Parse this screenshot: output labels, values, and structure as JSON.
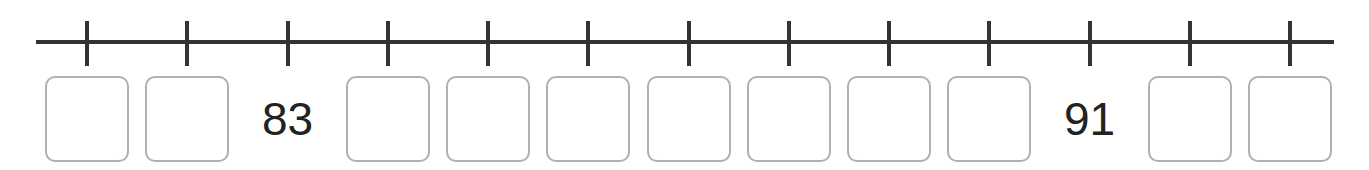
{
  "number_line": {
    "start": 81,
    "end": 93,
    "step": 1,
    "line_color": "#333333",
    "box_border_color": "#b0b0b0",
    "ticks": [
      {
        "value": 81,
        "shown": false,
        "label": ""
      },
      {
        "value": 82,
        "shown": false,
        "label": ""
      },
      {
        "value": 83,
        "shown": true,
        "label": "83"
      },
      {
        "value": 84,
        "shown": false,
        "label": ""
      },
      {
        "value": 85,
        "shown": false,
        "label": ""
      },
      {
        "value": 86,
        "shown": false,
        "label": ""
      },
      {
        "value": 87,
        "shown": false,
        "label": ""
      },
      {
        "value": 88,
        "shown": false,
        "label": ""
      },
      {
        "value": 89,
        "shown": false,
        "label": ""
      },
      {
        "value": 90,
        "shown": false,
        "label": ""
      },
      {
        "value": 91,
        "shown": true,
        "label": "91"
      },
      {
        "value": 92,
        "shown": false,
        "label": ""
      },
      {
        "value": 93,
        "shown": false,
        "label": ""
      }
    ]
  }
}
